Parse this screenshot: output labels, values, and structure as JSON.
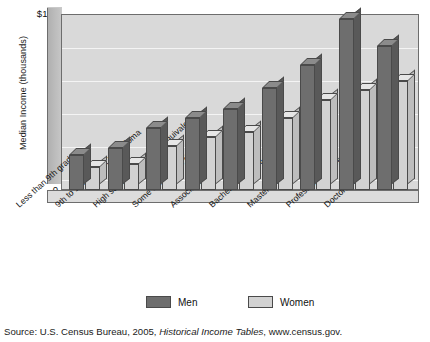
{
  "chart_data": {
    "type": "bar",
    "title": "",
    "xlabel": "",
    "ylabel": "Median Income (thousands)",
    "ylim": [
      0,
      100
    ],
    "yticks": [
      "$100",
      "80",
      "60",
      "40",
      "20",
      "0"
    ],
    "grid": true,
    "legend_position": "bottom",
    "categories": [
      "Less than 9th grade",
      "9th to 12th grade, no diploma",
      "High school diploma (or equivalent)",
      "Some college, no degree",
      "Associate's degree",
      "Bachelor's degree",
      "Master's degree",
      "Professional degree",
      "Doctoral degree"
    ],
    "series": [
      {
        "name": "Men",
        "color": "#6e6e6e",
        "values": [
          20,
          24,
          35,
          41,
          46,
          58,
          71,
          97,
          82
        ]
      },
      {
        "name": "Women",
        "color": "#d2d2d2",
        "values": [
          13,
          15,
          25,
          30,
          33,
          41,
          51,
          57,
          62
        ]
      }
    ]
  },
  "legend": {
    "men_label": "Men",
    "women_label": "Women"
  },
  "source": {
    "prefix": "Source:  U.S. Census Bureau, 2005, ",
    "italic": "Historical Income Tables",
    "suffix": ", www.census.gov."
  }
}
